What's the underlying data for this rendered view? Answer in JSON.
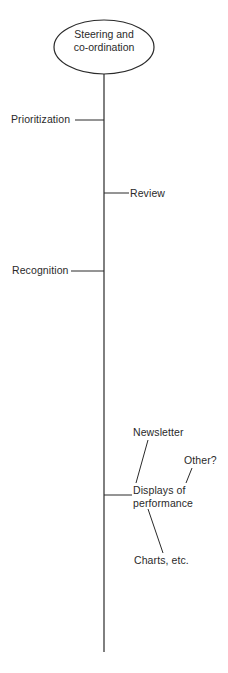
{
  "diagram": {
    "type": "tree",
    "root": {
      "label_line1": "Steering and",
      "label_line2": "co-ordination"
    },
    "branches": [
      {
        "label": "Prioritization",
        "side": "left"
      },
      {
        "label": "Review",
        "side": "right"
      },
      {
        "label": "Recognition",
        "side": "left"
      },
      {
        "label_line1": "Displays of",
        "label_line2": "performance",
        "side": "right",
        "children": [
          {
            "label": "Newsletter"
          },
          {
            "label": "Other?"
          },
          {
            "label": "Charts, etc."
          }
        ]
      }
    ],
    "colors": {
      "line": "#2a2a2a",
      "text": "#2a2a2a",
      "background": "#ffffff"
    }
  }
}
